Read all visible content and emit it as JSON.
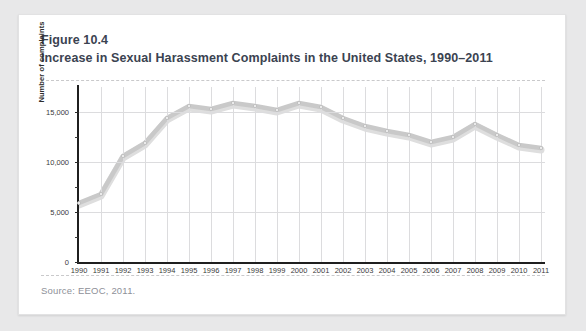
{
  "figure": {
    "number": "Figure 10.4",
    "title": "Increase in Sexual Harassment Complaints in the United States, 1990–2011",
    "source": "Source: EEOC, 2011."
  },
  "colors": {
    "title": "#3b4351",
    "line": "#c9c9c9",
    "line_shadow": "#dedede",
    "grid": "#dcdcde",
    "axis": "#1f1f1f",
    "card_bg": "#ffffff",
    "page_bg": "#e8e8e9",
    "source_text": "#8e9098"
  },
  "chart_data": {
    "type": "line",
    "title": "Increase in Sexual Harassment Complaints in the United States, 1990–2011",
    "xlabel": "",
    "ylabel": "Number of complaints",
    "categories": [
      "1990",
      "1991",
      "1992",
      "1993",
      "1994",
      "1995",
      "1996",
      "1997",
      "1998",
      "1999",
      "2000",
      "2001",
      "2002",
      "2003",
      "2004",
      "2005",
      "2006",
      "2007",
      "2008",
      "2009",
      "2010",
      "2011"
    ],
    "values": [
      5900,
      6800,
      10600,
      11900,
      14400,
      15600,
      15300,
      15900,
      15600,
      15200,
      15900,
      15500,
      14400,
      13600,
      13100,
      12700,
      12000,
      12500,
      13800,
      12700,
      11700,
      11400
    ],
    "ylim": [
      0,
      17500
    ],
    "yticks": [
      0,
      5000,
      10000,
      15000
    ],
    "ytick_labels": [
      "0",
      "5,000",
      "10,000",
      "15,000"
    ],
    "grid": true,
    "legend": false,
    "markers": true
  }
}
